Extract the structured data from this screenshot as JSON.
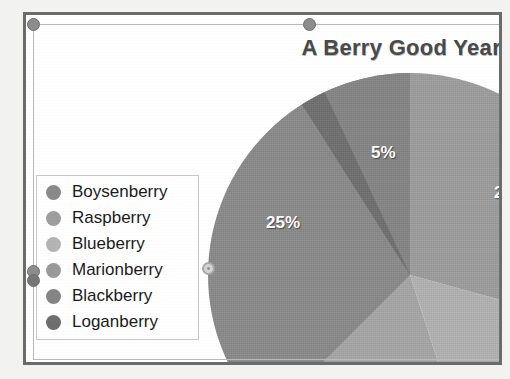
{
  "document": {
    "frame_border_color": "#6b6b6b",
    "canvas_background": "#ffffff"
  },
  "chart": {
    "title": "A Berry Good Year",
    "title_color": "#4a4a4a"
  },
  "legend": {
    "items": [
      {
        "label": "Boysenberry",
        "color": "#8a8a8a"
      },
      {
        "label": "Raspberry",
        "color": "#9e9e9e"
      },
      {
        "label": "Blueberry",
        "color": "#b4b4b4"
      },
      {
        "label": "Marionberry",
        "color": "#9a9a9a"
      },
      {
        "label": "Blackberry",
        "color": "#858585"
      },
      {
        "label": "Loganberry",
        "color": "#6e6e6e"
      }
    ]
  },
  "selection": {
    "handles": [
      {
        "name": "top-left",
        "style": "filled"
      },
      {
        "name": "top-center",
        "style": "filled"
      },
      {
        "name": "middle-left-a",
        "style": "filled"
      },
      {
        "name": "middle-left-b",
        "style": "filled"
      },
      {
        "name": "legend-right",
        "style": "hollow"
      }
    ]
  },
  "chart_data": {
    "type": "pie",
    "title": "A Berry Good Year",
    "xlabel": "",
    "ylabel": "",
    "categories": [
      "Boysenberry",
      "Raspberry",
      "Blueberry",
      "Marionberry",
      "Blackberry",
      "Loganberry"
    ],
    "values": [
      25,
      22,
      18,
      17,
      13,
      5
    ],
    "labels_visible": [
      "25%",
      "5%",
      "2"
    ],
    "legend_position": "left",
    "grid": false,
    "slices": [
      {
        "name": "Boysenberry",
        "percent": 25,
        "label": "25%",
        "color": "#8a8a8a",
        "start_deg": 198,
        "end_deg": 288
      },
      {
        "name": "Loganberry",
        "percent": 5,
        "label": "5%",
        "color": "#6e6e6e",
        "start_deg": 288,
        "end_deg": 306
      },
      {
        "name": "Blackberry",
        "percent": 13,
        "label": "",
        "color": "#858585",
        "start_deg": 306,
        "end_deg": 360
      },
      {
        "name": "Raspberry",
        "percent": 22,
        "label": "2",
        "color": "#9e9e9e",
        "start_deg": 0,
        "end_deg": 79
      },
      {
        "name": "Blueberry",
        "percent": 18,
        "label": "",
        "color": "#b4b4b4",
        "start_deg": 79,
        "end_deg": 144
      },
      {
        "name": "Marionberry",
        "percent": 17,
        "label": "",
        "color": "#a7a7a7",
        "start_deg": 144,
        "end_deg": 198
      }
    ]
  }
}
